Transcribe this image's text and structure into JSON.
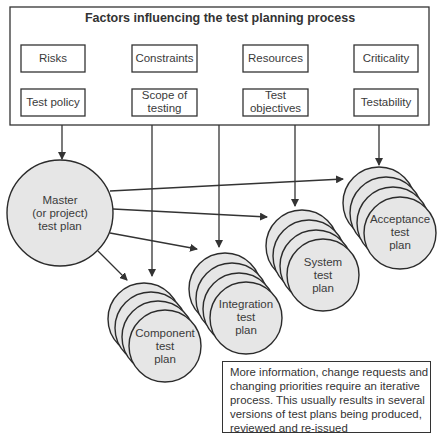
{
  "diagram": {
    "title": "Factors influencing the test planning process",
    "factors": [
      {
        "label": "Risks"
      },
      {
        "label": "Constraints"
      },
      {
        "label": "Resources"
      },
      {
        "label": "Criticality"
      },
      {
        "label": "Test policy"
      },
      {
        "label": "Scope of testing"
      },
      {
        "label": "Test objectives"
      },
      {
        "label": "Testability"
      }
    ],
    "master_plan": {
      "line1": "Master",
      "line2": "(or project)",
      "line3": "test plan"
    },
    "plans": [
      {
        "line1": "Component",
        "line2": "test",
        "line3": "plan"
      },
      {
        "line1": "Integration",
        "line2": "test",
        "line3": "plan"
      },
      {
        "line1": "System",
        "line2": "test",
        "line3": "plan"
      },
      {
        "line1": "Acceptance",
        "line2": "test",
        "line3": "plan"
      }
    ],
    "note": {
      "lines": [
        "More information, change requests and",
        "changing priorities require an iterative",
        "process. This usually results in several",
        "versions of test plans being produced,",
        "reviewed and re-issued"
      ]
    },
    "colors": {
      "line": "#333333",
      "circle_fill": "#e6e6e6",
      "background": "#ffffff"
    }
  }
}
